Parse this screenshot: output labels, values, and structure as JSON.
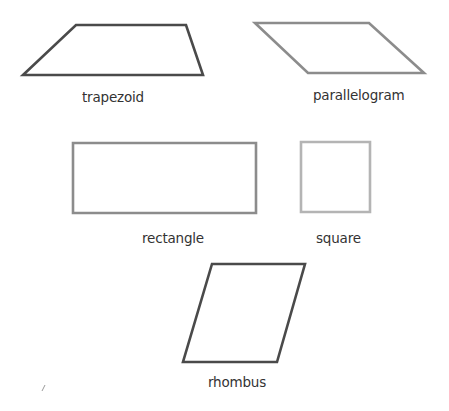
{
  "colors": {
    "background": "#ffffff",
    "dark_stroke": "#4a4a4a",
    "gray_stroke": "#8c8c8c",
    "light_stroke": "#b4b4b4",
    "label": "#333333"
  },
  "shapes": [
    {
      "name": "trapezoid",
      "label": "trapezoid",
      "points": "76,25 186,25 203,75 23,75",
      "stroke": "#4a4a4a",
      "label_pos": [
        82,
        91
      ]
    },
    {
      "name": "parallelogram",
      "label": "parallelogram",
      "points": "255,23 369,23 424,73 308,73",
      "stroke": "#8c8c8c",
      "label_pos": [
        313,
        89
      ]
    },
    {
      "name": "rectangle",
      "label": "rectangle",
      "points": "73,143 256,143 256,213 73,213",
      "stroke": "#8c8c8c",
      "label_pos": [
        142,
        232
      ]
    },
    {
      "name": "square",
      "label": "square",
      "points": "301,142 370,142 370,212 301,212",
      "stroke": "#b4b4b4",
      "label_pos": [
        316,
        232
      ]
    },
    {
      "name": "rhombus",
      "label": "rhombus",
      "points": "212,264 305,264 277,362 183,362",
      "stroke": "#4a4a4a",
      "label_pos": [
        208,
        376
      ]
    }
  ]
}
